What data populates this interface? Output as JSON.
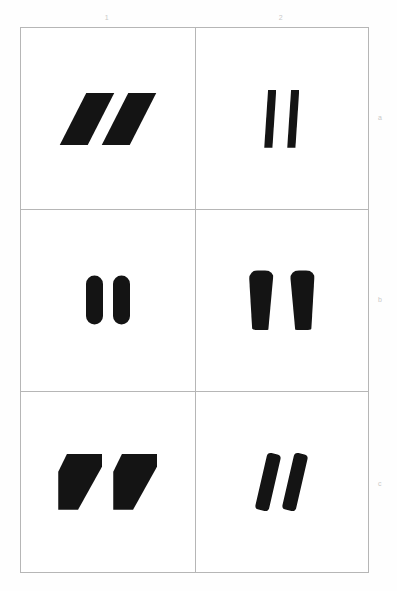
{
  "plate": {
    "background_color": "#ffffff",
    "border_color": "#b6b6b6",
    "mark_color": "#141414",
    "label_color": "#c9c9c9",
    "columns": [
      {
        "key": "1",
        "label": "1"
      },
      {
        "key": "2",
        "label": "2"
      }
    ],
    "rows": [
      {
        "key": "a",
        "label": "a"
      },
      {
        "key": "b",
        "label": "b"
      },
      {
        "key": "c",
        "label": "c"
      }
    ],
    "cells": [
      {
        "id": "a1",
        "row": "a",
        "column": "1",
        "shape_name": "slanted-parallelogram-pair",
        "description": "Two sharp-cornered parallelograms slanting to the right",
        "count": 2
      },
      {
        "id": "a2",
        "row": "a",
        "column": "2",
        "shape_name": "narrow-tapered-stroke-pair",
        "description": "Two narrow slanted strokes, wider at top, tapering toward the bottom",
        "count": 2
      },
      {
        "id": "b1",
        "row": "b",
        "column": "1",
        "shape_name": "vertical-capsule-pair",
        "description": "Two upright capsules with fully rounded ends",
        "count": 2
      },
      {
        "id": "b2",
        "row": "b",
        "column": "2",
        "shape_name": "teardrop-wedge-pair",
        "description": "Two comma-like wedges, broad rounded tops tapering to narrow bottoms",
        "count": 2
      },
      {
        "id": "c1",
        "row": "c",
        "column": "1",
        "shape_name": "pentagon-wedge-pair",
        "description": "Two heavy pentagonal wedges with a diagonal cut at the lower right",
        "count": 2
      },
      {
        "id": "c2",
        "row": "c",
        "column": "2",
        "shape_name": "slanted-rounded-bar-pair",
        "description": "Two tilted bars with rounded corners",
        "count": 2
      }
    ]
  }
}
